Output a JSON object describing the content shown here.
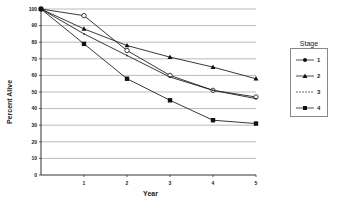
{
  "chart_data": {
    "type": "line",
    "title": "",
    "xlabel": "Year",
    "ylabel": "Percent Alive",
    "x": [
      0,
      1,
      2,
      3,
      4,
      5
    ],
    "x_tick_labels": [
      "1",
      "2",
      "3",
      "4",
      "5"
    ],
    "y_tick_labels": [
      "0",
      "10",
      "20",
      "30",
      "40",
      "50",
      "60",
      "70",
      "80",
      "90",
      "100"
    ],
    "ylim": [
      0,
      100
    ],
    "xlim": [
      0,
      5
    ],
    "grid": "horizontal",
    "legend_title": "Stage",
    "legend_position": "right",
    "series": [
      {
        "name": "1",
        "marker": "circle",
        "values": [
          100,
          96,
          75,
          60,
          51,
          47
        ]
      },
      {
        "name": "2",
        "marker": "triangle",
        "values": [
          100,
          88,
          78,
          71,
          65,
          58
        ]
      },
      {
        "name": "3",
        "marker": "dash",
        "values": [
          100,
          85,
          72,
          59,
          51,
          46
        ]
      },
      {
        "name": "4",
        "marker": "square",
        "values": [
          100,
          79,
          58,
          45,
          33,
          31
        ]
      }
    ]
  },
  "legend": {
    "title": "Stage",
    "items": [
      {
        "label": "1"
      },
      {
        "label": "2"
      },
      {
        "label": "3"
      },
      {
        "label": "4"
      }
    ]
  }
}
